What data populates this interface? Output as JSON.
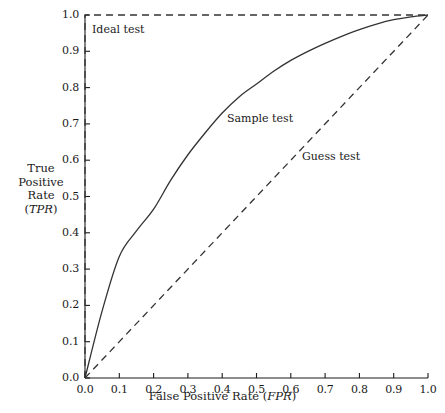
{
  "chart_data": {
    "type": "line",
    "title": "",
    "xlabel": "False Positive Rate (FPR)",
    "xlabel_plain": "False Positive Rate",
    "xlabel_symbol": "FPR",
    "ylabel": "True Positive Rate (TPR)",
    "ylabel_lines": [
      "True",
      "Positive",
      "Rate"
    ],
    "ylabel_symbol": "TPR",
    "xlim": [
      0.0,
      1.0
    ],
    "ylim": [
      0.0,
      1.0
    ],
    "grid": false,
    "legend_position": "inline-annotations",
    "xticks": [
      "0.0",
      "0.1",
      "0.2",
      "0.3",
      "0.4",
      "0.5",
      "0.6",
      "0.7",
      "0.8",
      "0.9",
      "1.0"
    ],
    "yticks": [
      "0.0",
      "0.1",
      "0.2",
      "0.3",
      "0.4",
      "0.5",
      "0.6",
      "0.7",
      "0.8",
      "0.9",
      "1.0"
    ],
    "xtick_values": [
      0.0,
      0.1,
      0.2,
      0.3,
      0.4,
      0.5,
      0.6,
      0.7,
      0.8,
      0.9,
      1.0
    ],
    "ytick_values": [
      0.0,
      0.1,
      0.2,
      0.3,
      0.4,
      0.5,
      0.6,
      0.7,
      0.8,
      0.9,
      1.0
    ],
    "series": [
      {
        "name": "Ideal test",
        "label": "Ideal test",
        "style": "dashed",
        "color": "#333333",
        "x": [
          0.0,
          0.0,
          1.0
        ],
        "y": [
          0.0,
          1.0,
          1.0
        ]
      },
      {
        "name": "Sample test",
        "label": "Sample test",
        "style": "solid",
        "color": "#333333",
        "x": [
          0.0,
          0.05,
          0.1,
          0.15,
          0.2,
          0.25,
          0.3,
          0.35,
          0.4,
          0.45,
          0.5,
          0.55,
          0.6,
          0.65,
          0.7,
          0.75,
          0.8,
          0.85,
          0.9,
          0.95,
          1.0
        ],
        "y": [
          0.0,
          0.185,
          0.335,
          0.405,
          0.465,
          0.545,
          0.615,
          0.675,
          0.73,
          0.775,
          0.81,
          0.845,
          0.875,
          0.9,
          0.922,
          0.942,
          0.96,
          0.975,
          0.987,
          0.995,
          1.0
        ]
      },
      {
        "name": "Guess test",
        "label": "Guess test",
        "style": "dashed",
        "color": "#333333",
        "x": [
          0.0,
          1.0
        ],
        "y": [
          0.0,
          1.0
        ]
      }
    ],
    "annotations": [
      {
        "text": "Ideal test",
        "x": 0.03,
        "y": 0.96
      },
      {
        "text": "Sample test",
        "x": 0.42,
        "y": 0.72
      },
      {
        "text": "Guess test",
        "x": 0.64,
        "y": 0.62
      }
    ]
  },
  "axes": {
    "x_title_prefix": "False Positive Rate (",
    "x_title_symbol": "FPR",
    "x_title_suffix": ")",
    "y_line1": "True",
    "y_line2": "Positive",
    "y_line3": "Rate",
    "y_line4_prefix": "(",
    "y_line4_symbol": "TPR",
    "y_line4_suffix": ")"
  },
  "labels": {
    "ideal": "Ideal test",
    "sample": "Sample test",
    "guess": "Guess test"
  },
  "colors": {
    "line": "#333333",
    "axis": "#1a1a1a",
    "background": "#ffffff",
    "text": "#1a1a1a"
  }
}
